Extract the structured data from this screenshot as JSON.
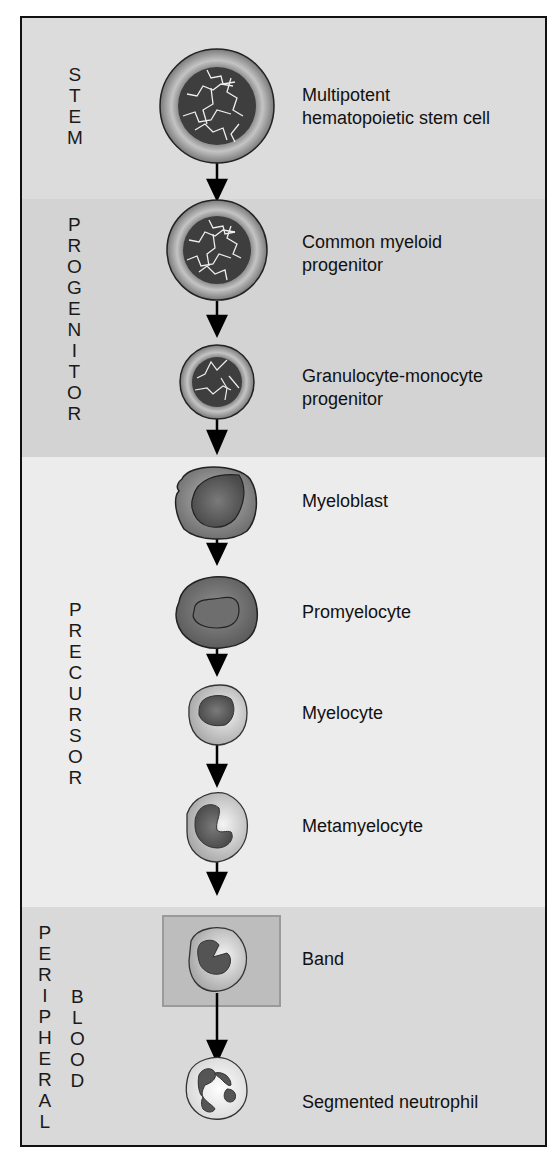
{
  "diagram": {
    "colors": {
      "frame": "#111111",
      "stem_bg": "#dcdcdc",
      "progenitor_bg": "#d3d3d3",
      "precursor_bg": "#ececec",
      "peripheral_bg": "#d9d9d9",
      "band_highlight_bg": "#bdbdbd",
      "nucleus_dark": "#3a3a3a",
      "arrow": "#000000"
    },
    "stages": [
      {
        "id": "stem",
        "label": "STEM",
        "letters": [
          "S",
          "T",
          "E",
          "M"
        ]
      },
      {
        "id": "progenitor",
        "label": "PROGENITOR",
        "letters": [
          "P",
          "R",
          "O",
          "G",
          "E",
          "N",
          "I",
          "T",
          "O",
          "R"
        ]
      },
      {
        "id": "precursor",
        "label": "PRECURSOR",
        "letters": [
          "P",
          "R",
          "E",
          "C",
          "U",
          "R",
          "S",
          "O",
          "R"
        ]
      },
      {
        "id": "peripheral_blood",
        "label": "PERIPHERAL BLOOD",
        "letters_col1": [
          "P",
          "E",
          "R",
          "I",
          "P",
          "H",
          "E",
          "R",
          "A",
          "L"
        ],
        "letters_col2": [
          "B",
          "L",
          "O",
          "O",
          "D"
        ]
      }
    ],
    "cells": [
      {
        "id": "hsc",
        "stage": "stem",
        "line1": "Multipotent",
        "line2": "hematopoietic stem cell"
      },
      {
        "id": "cmp",
        "stage": "progenitor",
        "line1": "Common myeloid",
        "line2": "progenitor"
      },
      {
        "id": "gmp",
        "stage": "progenitor",
        "line1": "Granulocyte-monocyte",
        "line2": "progenitor"
      },
      {
        "id": "myeloblast",
        "stage": "precursor",
        "line1": "Myeloblast"
      },
      {
        "id": "promyelocyte",
        "stage": "precursor",
        "line1": "Promyelocyte"
      },
      {
        "id": "myelocyte",
        "stage": "precursor",
        "line1": "Myelocyte"
      },
      {
        "id": "metamyelocyte",
        "stage": "precursor",
        "line1": "Metamyelocyte"
      },
      {
        "id": "band",
        "stage": "peripheral_blood",
        "line1": "Band",
        "highlighted": true
      },
      {
        "id": "segmented_neutrophil",
        "stage": "peripheral_blood",
        "line1": "Segmented neutrophil"
      }
    ]
  }
}
